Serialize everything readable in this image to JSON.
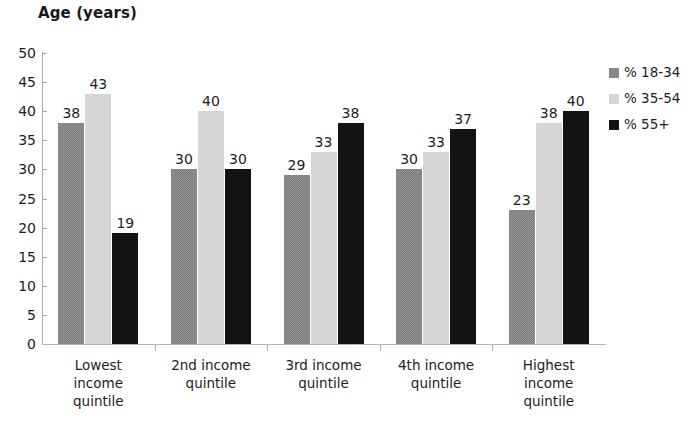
{
  "chart_data": {
    "type": "bar",
    "title": "Age (years)",
    "xlabel": "",
    "ylabel": "",
    "ylim": [
      0,
      50
    ],
    "ytick_step": 5,
    "yticks": [
      50,
      45,
      40,
      35,
      30,
      25,
      20,
      15,
      10,
      5,
      0
    ],
    "grid": false,
    "legend_position": "right",
    "categories": [
      "Lowest income quintile",
      "2nd income quintile",
      "3rd income quintile",
      "4th income quintile",
      "Highest income quintile"
    ],
    "series": [
      {
        "name": "% 18-34",
        "color": "#7d7d7d",
        "values": [
          38,
          30,
          29,
          30,
          23
        ],
        "labels": [
          "38",
          "30",
          "29",
          "30",
          "23"
        ]
      },
      {
        "name": "% 35-54",
        "color": "#cfcfcf",
        "values": [
          43,
          40,
          33,
          33,
          38
        ],
        "labels": [
          "43",
          "40",
          "33",
          "33",
          "38"
        ]
      },
      {
        "name": "% 55+",
        "color": "#0d0d0d",
        "values": [
          19,
          30,
          38,
          37,
          40
        ],
        "labels": [
          "19",
          "30",
          "38",
          "37",
          "40"
        ]
      }
    ]
  },
  "legend": {
    "items": [
      {
        "label": "% 18-34",
        "color": "#7d7d7d"
      },
      {
        "label": "% 35-54",
        "color": "#cfcfcf"
      },
      {
        "label": "% 55+",
        "color": "#0d0d0d"
      }
    ]
  },
  "axis": {
    "y_tick_labels": [
      "50",
      "45",
      "40",
      "35",
      "30",
      "25",
      "20",
      "15",
      "10",
      "5",
      "0"
    ]
  },
  "category_lines": [
    [
      "Lowest",
      "income",
      "quintile"
    ],
    [
      "2nd income",
      "quintile"
    ],
    [
      "3rd income",
      "quintile"
    ],
    [
      "4th income",
      "quintile"
    ],
    [
      "Highest",
      "income",
      "quintile"
    ]
  ]
}
